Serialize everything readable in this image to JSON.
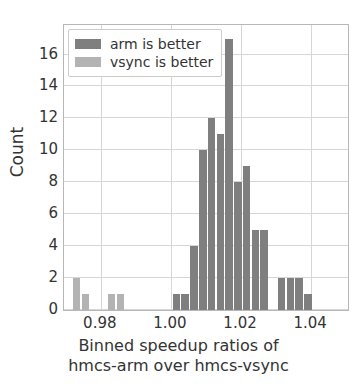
{
  "chart_data": {
    "type": "bar",
    "title": "",
    "subtitle": "",
    "xlabel_line1": "Binned speedup ratios of",
    "xlabel_line2": "hmcs-arm over hmcs-vsync",
    "ylabel": "Count",
    "xlim": [
      0.9695,
      1.0505
    ],
    "ylim": [
      0,
      17.85
    ],
    "xticks": [
      0.98,
      1.0,
      1.02,
      1.04
    ],
    "xticklabels": [
      "0.98",
      "1.00",
      "1.02",
      "1.04"
    ],
    "yticks": [
      0,
      2,
      4,
      6,
      8,
      10,
      12,
      14,
      16
    ],
    "yticklabels": [
      "0",
      "2",
      "4",
      "6",
      "8",
      "10",
      "12",
      "14",
      "16"
    ],
    "grid": true,
    "legend_position": "upper left",
    "bin_width": 0.0025,
    "series": [
      {
        "name": "arm is better",
        "color": "#7f7f7f",
        "bins": [
          {
            "x": 1.0005,
            "value": 1
          },
          {
            "x": 1.003,
            "value": 1
          },
          {
            "x": 1.0055,
            "value": 4
          },
          {
            "x": 1.008,
            "value": 10
          },
          {
            "x": 1.0105,
            "value": 12
          },
          {
            "x": 1.013,
            "value": 11
          },
          {
            "x": 1.0155,
            "value": 17
          },
          {
            "x": 1.018,
            "value": 8
          },
          {
            "x": 1.0205,
            "value": 9
          },
          {
            "x": 1.023,
            "value": 5
          },
          {
            "x": 1.0255,
            "value": 5
          },
          {
            "x": 1.0305,
            "value": 2
          },
          {
            "x": 1.033,
            "value": 2
          },
          {
            "x": 1.0355,
            "value": 2
          },
          {
            "x": 1.038,
            "value": 1
          }
        ]
      },
      {
        "name": "vsync is better",
        "color": "#b3b3b3",
        "bins": [
          {
            "x": 0.972,
            "value": 2
          },
          {
            "x": 0.9745,
            "value": 1
          },
          {
            "x": 0.982,
            "value": 1
          },
          {
            "x": 0.9845,
            "value": 1
          }
        ]
      }
    ]
  },
  "legend": {
    "items": [
      {
        "label": "arm is better",
        "color": "#7f7f7f"
      },
      {
        "label": "vsync is better",
        "color": "#b3b3b3"
      }
    ]
  }
}
